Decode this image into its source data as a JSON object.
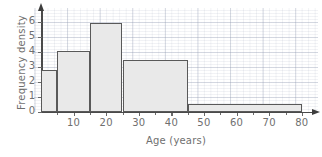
{
  "chart_data": {
    "type": "bar",
    "title": "",
    "subtitle": "",
    "xlabel": "Age (years)",
    "ylabel": "Frequency density",
    "xlim": [
      0,
      82
    ],
    "ylim": [
      0,
      6.9
    ],
    "grid": true,
    "legend": null,
    "xticks": [
      10,
      20,
      30,
      40,
      50,
      60,
      70,
      80
    ],
    "xtick_labels": [
      "10",
      "20",
      "30",
      "40",
      "50",
      "60",
      "70",
      "80"
    ],
    "yticks": [
      0,
      1,
      2,
      3,
      4,
      5,
      6
    ],
    "ytick_labels": [
      "0",
      "1",
      "2",
      "3",
      "4",
      "5",
      "6"
    ],
    "bars": [
      {
        "label": "0-5",
        "x_start": 0,
        "x_end": 5,
        "value": 2.8
      },
      {
        "label": "5-15",
        "x_start": 5,
        "x_end": 15,
        "value": 4.1
      },
      {
        "label": "15-25",
        "x_start": 15,
        "x_end": 25,
        "value": 5.95
      },
      {
        "label": "25-45",
        "x_start": 25,
        "x_end": 45,
        "value": 3.5
      },
      {
        "label": "45-80",
        "x_start": 45,
        "x_end": 80,
        "value": 0.55
      }
    ],
    "colors": {
      "bar_fill": "#e9e9e9",
      "bar_edge": "#595959",
      "axis": "#4a4a4a",
      "grid_minor": "#dfe3ea",
      "grid_major": "#c9cfdb",
      "text": "#6f6f6f",
      "background": "#ffffff"
    }
  }
}
